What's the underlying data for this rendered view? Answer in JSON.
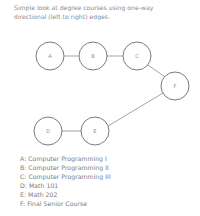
{
  "title": {
    "line1": "Simple look at degree courses using one-way",
    "line2": "directional (left to right) edges.",
    "text": "Simple look at degree courses using one-way\ndirectional (left to right) edges."
  },
  "colors": {
    "background": "#ffffff",
    "node_stroke": "#7a7a7a",
    "node_fill": "#ffffff",
    "edge_stroke": "#9a9a9a",
    "text": "#7c7c7c",
    "title_text": "#8a8a8a",
    "node_label": "#8d8d8d"
  },
  "graph": {
    "type": "directed-graph",
    "direction": "left-to-right",
    "node_radius": 14,
    "nodes": [
      {
        "id": "A",
        "label": "A",
        "cx": 50,
        "cy": 56
      },
      {
        "id": "B",
        "label": "B",
        "cx": 93,
        "cy": 56
      },
      {
        "id": "C",
        "label": "C",
        "cx": 137,
        "cy": 56
      },
      {
        "id": "F",
        "label": "F",
        "cx": 175,
        "cy": 86
      },
      {
        "id": "D",
        "label": "D",
        "cx": 48,
        "cy": 131
      },
      {
        "id": "E",
        "label": "E",
        "cx": 95,
        "cy": 131
      }
    ],
    "edges": [
      {
        "from": "A",
        "to": "B",
        "x1": 64,
        "y1": 56,
        "x2": 79,
        "y2": 56
      },
      {
        "from": "B",
        "to": "C",
        "x1": 107,
        "y1": 56,
        "x2": 123,
        "y2": 56
      },
      {
        "from": "C",
        "to": "F",
        "x1": 148,
        "y1": 65,
        "x2": 165,
        "y2": 77
      },
      {
        "from": "D",
        "to": "E",
        "x1": 62,
        "y1": 131,
        "x2": 81,
        "y2": 131
      },
      {
        "from": "E",
        "to": "F",
        "x1": 108,
        "y1": 126,
        "x2": 163,
        "y2": 93
      }
    ]
  },
  "legend": {
    "entries": [
      {
        "key": "A",
        "line": "A: Computer Programming I"
      },
      {
        "key": "B",
        "line": "B: Computer Programming II"
      },
      {
        "key": "C",
        "line": "C: Computer Programming III"
      },
      {
        "key": "D",
        "line": "D: Math 101"
      },
      {
        "key": "E",
        "line": "E: Math 202"
      },
      {
        "key": "F",
        "line": "F: Final Senior Course"
      }
    ]
  }
}
